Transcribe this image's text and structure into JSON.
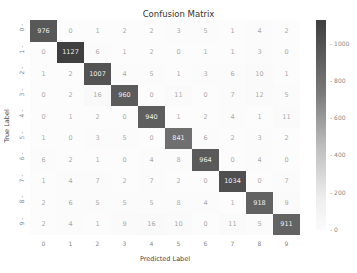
{
  "chart_data": {
    "type": "heatmap",
    "title": "Confusion Matrix",
    "xlabel": "Predicted Label",
    "ylabel": "True Label",
    "x_ticks": [
      "0",
      "1",
      "2",
      "3",
      "4",
      "5",
      "6",
      "7",
      "8",
      "9"
    ],
    "y_ticks": [
      "0",
      "1",
      "2",
      "3",
      "4",
      "5",
      "6",
      "7",
      "8",
      "9"
    ],
    "matrix": [
      [
        976,
        0,
        1,
        2,
        2,
        3,
        5,
        1,
        4,
        2
      ],
      [
        0,
        1127,
        6,
        1,
        2,
        0,
        1,
        1,
        3,
        0
      ],
      [
        1,
        2,
        1007,
        4,
        5,
        1,
        3,
        6,
        10,
        1
      ],
      [
        0,
        2,
        16,
        960,
        0,
        11,
        0,
        7,
        12,
        5
      ],
      [
        0,
        1,
        2,
        0,
        940,
        1,
        2,
        4,
        1,
        11
      ],
      [
        1,
        0,
        3,
        5,
        0,
        841,
        6,
        2,
        3,
        2
      ],
      [
        6,
        2,
        1,
        0,
        4,
        8,
        964,
        0,
        4,
        0
      ],
      [
        1,
        4,
        7,
        2,
        7,
        2,
        0,
        1034,
        0,
        7
      ],
      [
        2,
        6,
        5,
        5,
        5,
        8,
        4,
        1,
        918,
        9
      ],
      [
        2,
        4,
        1,
        9,
        16,
        10,
        0,
        11,
        5,
        911
      ]
    ],
    "colorbar": {
      "min": 0,
      "max": 1127,
      "ticks": [
        "0",
        "200",
        "400",
        "600",
        "800",
        "1000"
      ],
      "colormap": "Greys"
    },
    "grid": false
  }
}
